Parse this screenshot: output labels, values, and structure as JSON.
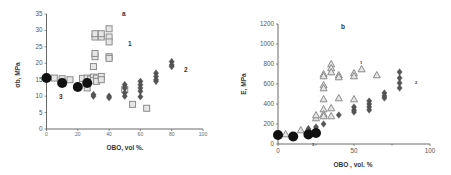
{
  "chart_data": [
    {
      "panel": "a",
      "type": "scatter",
      "title": "a",
      "xlabel": "OBO, vol %.",
      "ylabel": "σb, MPa",
      "xlim": [
        0,
        100
      ],
      "ylim": [
        0,
        35
      ],
      "xticks": [
        "0",
        "20",
        "40",
        "60",
        "80",
        "100"
      ],
      "yticks": [
        "0",
        "5",
        "10",
        "15",
        "20",
        "25",
        "30",
        "35"
      ],
      "grid": false,
      "annotations": [
        "1",
        "2",
        "3"
      ],
      "series": [
        {
          "name": "1",
          "marker": "square-open",
          "color": "#9a9a9a",
          "points": [
            [
              5,
              15.5
            ],
            [
              10,
              15.3
            ],
            [
              15,
              15
            ],
            [
              23,
              15.4
            ],
            [
              26,
              12.5
            ],
            [
              26,
              15.5
            ],
            [
              28,
              15.2
            ],
            [
              30,
              19
            ],
            [
              30,
              15.8
            ],
            [
              30,
              14.8
            ],
            [
              31,
              22
            ],
            [
              31,
              23
            ],
            [
              31,
              28
            ],
            [
              31,
              29
            ],
            [
              32,
              15.5
            ],
            [
              32,
              14.5
            ],
            [
              35,
              28
            ],
            [
              35,
              29
            ],
            [
              35,
              16
            ],
            [
              35,
              15
            ],
            [
              40,
              30.5
            ],
            [
              40,
              28
            ],
            [
              40,
              26.5
            ],
            [
              40,
              22
            ],
            [
              40,
              21.5
            ],
            [
              50,
              12
            ],
            [
              55,
              7.5
            ],
            [
              64,
              6.3
            ]
          ]
        },
        {
          "name": "2",
          "marker": "diamond-filled",
          "color": "#555555",
          "points": [
            [
              30,
              10.5
            ],
            [
              30,
              10
            ],
            [
              40,
              10
            ],
            [
              40,
              9.5
            ],
            [
              50,
              13.5
            ],
            [
              50,
              12.5
            ],
            [
              50,
              11
            ],
            [
              50,
              10
            ],
            [
              60,
              14.5
            ],
            [
              60,
              13.5
            ],
            [
              60,
              12.5
            ],
            [
              60,
              11.5
            ],
            [
              60,
              9.8
            ],
            [
              70,
              17
            ],
            [
              70,
              16
            ],
            [
              70,
              15
            ],
            [
              70,
              14.5
            ],
            [
              80,
              20.5
            ],
            [
              80,
              19.5
            ],
            [
              80,
              19
            ]
          ]
        },
        {
          "name": "3",
          "marker": "circle-filled",
          "color": "#111111",
          "points": [
            [
              0,
              15.5
            ],
            [
              10,
              14
            ],
            [
              20,
              12.8
            ],
            [
              26,
              14
            ]
          ]
        }
      ]
    },
    {
      "panel": "b",
      "type": "scatter",
      "title": "b",
      "xlabel": "OBO , vol. %",
      "ylabel": "E, MPa",
      "xlim": [
        0,
        100
      ],
      "ylim": [
        0,
        1200
      ],
      "xticks": [
        "0",
        "50",
        "100"
      ],
      "yticks": [
        "0",
        "200",
        "400",
        "600",
        "800",
        "1000",
        "1200"
      ],
      "grid": false,
      "annotations": [
        "1",
        "2",
        "3"
      ],
      "series": [
        {
          "name": "1",
          "marker": "triangle-open",
          "color": "#9a9a9a",
          "points": [
            [
              5,
              100
            ],
            [
              15,
              140
            ],
            [
              20,
              150
            ],
            [
              25,
              260
            ],
            [
              25,
              290
            ],
            [
              30,
              700
            ],
            [
              30,
              680
            ],
            [
              30,
              590
            ],
            [
              30,
              560
            ],
            [
              30,
              450
            ],
            [
              30,
              350
            ],
            [
              30,
              300
            ],
            [
              30,
              280
            ],
            [
              35,
              800
            ],
            [
              35,
              760
            ],
            [
              35,
              720
            ],
            [
              35,
              360
            ],
            [
              35,
              280
            ],
            [
              40,
              690
            ],
            [
              40,
              670
            ],
            [
              40,
              460
            ],
            [
              50,
              710
            ],
            [
              50,
              680
            ],
            [
              50,
              450
            ],
            [
              55,
              750
            ],
            [
              65,
              690
            ]
          ]
        },
        {
          "name": "2",
          "marker": "diamond-filled",
          "color": "#555555",
          "points": [
            [
              20,
              150
            ],
            [
              25,
              170
            ],
            [
              30,
              200
            ],
            [
              40,
              290
            ],
            [
              50,
              370
            ],
            [
              50,
              340
            ],
            [
              50,
              320
            ],
            [
              60,
              430
            ],
            [
              60,
              400
            ],
            [
              60,
              370
            ],
            [
              60,
              340
            ],
            [
              70,
              510
            ],
            [
              70,
              480
            ],
            [
              70,
              460
            ],
            [
              80,
              720
            ],
            [
              80,
              660
            ],
            [
              80,
              610
            ],
            [
              80,
              560
            ]
          ]
        },
        {
          "name": "3",
          "marker": "circle-filled",
          "color": "#111111",
          "points": [
            [
              0,
              90
            ],
            [
              10,
              75
            ],
            [
              20,
              95
            ],
            [
              25,
              110
            ]
          ]
        }
      ]
    }
  ],
  "panels": {
    "a": {
      "title": "a",
      "ylabel": "σb, MPa",
      "xlabel": "OBO, vol %.",
      "label1": "1",
      "label2": "2",
      "label3": "3"
    },
    "b": {
      "title": "b",
      "ylabel": "E, MPa",
      "xlabel": "OBO , vol. %",
      "label1": "1",
      "label2": "2",
      "label3": "3"
    }
  }
}
